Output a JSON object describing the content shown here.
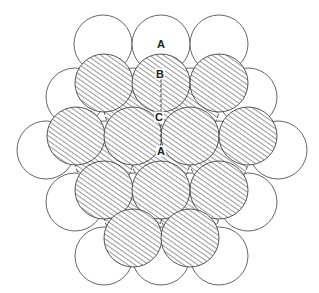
{
  "diagram": {
    "title": "",
    "radius": 29,
    "colors": {
      "stroke": "#555555",
      "hatch": "#444444",
      "background": "#ffffff"
    },
    "layers": {
      "A": {
        "style": "plain",
        "centers": [
          [
            103,
            44
          ],
          [
            161,
            44
          ],
          [
            219,
            44
          ],
          [
            75,
            97
          ],
          [
            133,
            97
          ],
          [
            190,
            97
          ],
          [
            248,
            97
          ],
          [
            46,
            150
          ],
          [
            104,
            150
          ],
          [
            161,
            150
          ],
          [
            219,
            150
          ],
          [
            278,
            150
          ],
          [
            75,
            202
          ],
          [
            133,
            202
          ],
          [
            190,
            202
          ],
          [
            248,
            202
          ],
          [
            104,
            256
          ],
          [
            161,
            256
          ],
          [
            219,
            256
          ]
        ]
      },
      "C": {
        "style": "hatched-dashed",
        "centers": [
          [
            133,
            108
          ],
          [
            190,
            108
          ],
          [
            104,
            160
          ],
          [
            161,
            160
          ],
          [
            219,
            160
          ],
          [
            133,
            214
          ],
          [
            190,
            214
          ]
        ]
      },
      "B": {
        "style": "hatched",
        "centers": [
          [
            104,
            83
          ],
          [
            161,
            83
          ],
          [
            219,
            83
          ],
          [
            76,
            136
          ],
          [
            133,
            136
          ],
          [
            190,
            136
          ],
          [
            248,
            136
          ],
          [
            104,
            190
          ],
          [
            161,
            190
          ],
          [
            219,
            190
          ],
          [
            133,
            238
          ],
          [
            190,
            238
          ]
        ]
      }
    },
    "labels": [
      {
        "text": "A",
        "x": 161,
        "y": 44
      },
      {
        "text": "B",
        "x": 160,
        "y": 74
      },
      {
        "text": "C",
        "x": 159,
        "y": 117
      },
      {
        "text": "A",
        "x": 161,
        "y": 151
      }
    ],
    "guide_line": {
      "x1": 161,
      "y1": 79,
      "x2": 161,
      "y2": 145
    }
  }
}
